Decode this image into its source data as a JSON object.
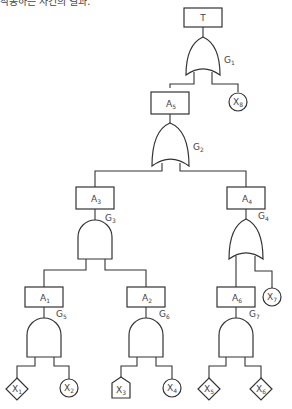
{
  "caption": "작동하는 사건의 결과.",
  "diagram": {
    "type": "fault-tree",
    "top_event": "T",
    "events": [
      {
        "id": "T",
        "label": "T",
        "sub": ""
      },
      {
        "id": "A5",
        "label": "A",
        "sub": "5"
      },
      {
        "id": "A3",
        "label": "A",
        "sub": "3"
      },
      {
        "id": "A4",
        "label": "A",
        "sub": "4"
      },
      {
        "id": "A1",
        "label": "A",
        "sub": "1"
      },
      {
        "id": "A2",
        "label": "A",
        "sub": "2"
      },
      {
        "id": "A6",
        "label": "A",
        "sub": "6"
      }
    ],
    "gates": [
      {
        "id": "G1",
        "label": "G",
        "sub": "1",
        "type": "OR",
        "output": "T",
        "inputs": [
          "A5",
          "X8"
        ]
      },
      {
        "id": "G2",
        "label": "G",
        "sub": "2",
        "type": "OR",
        "output": "A5",
        "inputs": [
          "A3",
          "A4"
        ]
      },
      {
        "id": "G3",
        "label": "G",
        "sub": "3",
        "type": "AND",
        "output": "A3",
        "inputs": [
          "A1",
          "A2"
        ]
      },
      {
        "id": "G4",
        "label": "G",
        "sub": "4",
        "type": "OR",
        "output": "A4",
        "inputs": [
          "A6",
          "X7"
        ]
      },
      {
        "id": "G5",
        "label": "G",
        "sub": "5",
        "type": "AND",
        "output": "A1",
        "inputs": [
          "X1",
          "X2"
        ]
      },
      {
        "id": "G6",
        "label": "G",
        "sub": "6",
        "type": "AND",
        "output": "A2",
        "inputs": [
          "X3",
          "X4"
        ]
      },
      {
        "id": "G7",
        "label": "G",
        "sub": "7",
        "type": "AND",
        "output": "A6",
        "inputs": [
          "X5",
          "X6"
        ]
      }
    ],
    "basic_events": [
      {
        "id": "X1",
        "label": "X",
        "sub": "1",
        "shape": "diamond"
      },
      {
        "id": "X2",
        "label": "X",
        "sub": "2",
        "shape": "circle"
      },
      {
        "id": "X3",
        "label": "X",
        "sub": "3",
        "shape": "house"
      },
      {
        "id": "X4",
        "label": "X",
        "sub": "4",
        "shape": "circle"
      },
      {
        "id": "X5",
        "label": "X",
        "sub": "5",
        "shape": "diamond"
      },
      {
        "id": "X6",
        "label": "X",
        "sub": "6",
        "shape": "diamond"
      },
      {
        "id": "X7",
        "label": "X",
        "sub": "7",
        "shape": "circle"
      },
      {
        "id": "X8",
        "label": "X",
        "sub": "8",
        "shape": "circle"
      }
    ]
  }
}
